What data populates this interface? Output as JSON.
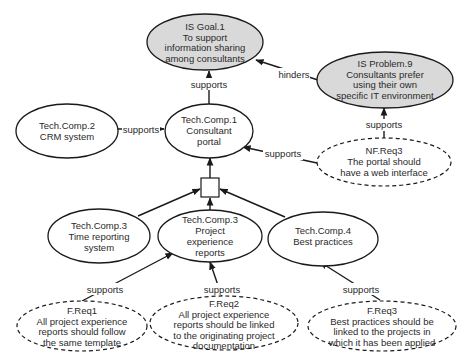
{
  "nodes": {
    "goal1": {
      "lines": [
        "IS Goal.1",
        "To support",
        "information sharing",
        "among consultants"
      ]
    },
    "problem9": {
      "lines": [
        "IS Problem.9",
        "Consultants prefer",
        "using their own",
        "specific IT environment"
      ]
    },
    "comp1": {
      "lines": [
        "Tech.Comp.1",
        "Consultant",
        "portal"
      ]
    },
    "comp2": {
      "lines": [
        "Tech.Comp.2",
        "CRM system"
      ]
    },
    "nfreq3": {
      "lines": [
        "NF.Req3",
        "The portal should",
        "have a web interface"
      ]
    },
    "comp3time": {
      "lines": [
        "Tech.Comp.3",
        "Time reporting",
        "system"
      ]
    },
    "comp3proj": {
      "lines": [
        "Tech.Comp.3",
        "Project",
        "experience",
        "reports"
      ]
    },
    "comp4": {
      "lines": [
        "Tech.Comp.4",
        "Best practices"
      ]
    },
    "freq1": {
      "lines": [
        "F.Req1",
        "All project experience",
        "reports should follow",
        "the same template"
      ]
    },
    "freq2": {
      "lines": [
        "F.Req2",
        "All project experience",
        "reports should be linked",
        "to the originating project",
        "documentation"
      ]
    },
    "freq3": {
      "lines": [
        "F.Req3",
        "Best practices should be",
        "linked to the projects in",
        "which it has been applied"
      ]
    }
  },
  "edges": {
    "comp1_goal1": "supports",
    "problem9_goal1": "hinders",
    "comp2_comp1": "supports",
    "nfreq3_problem9": "supports",
    "nfreq3_comp1": "supports",
    "freq1_comp3proj": "supports",
    "freq2_comp3proj": "supports",
    "freq3_comp4": "supports"
  },
  "colors": {
    "is_node_fill": "#d9d9d9",
    "node_fill": "#ffffff",
    "stroke": "#1a1a1a"
  }
}
